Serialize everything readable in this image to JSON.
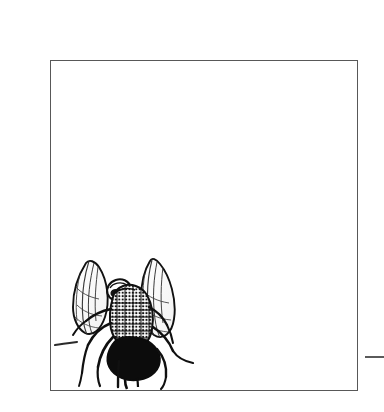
{
  "page": {
    "background_color": "#ffffff",
    "width": 384,
    "height": 412
  },
  "figure": {
    "frame": {
      "border_color": "#585858",
      "border_width_px": 1.4,
      "fill_color": "#ffffff",
      "left": 50,
      "top": 60,
      "width": 308,
      "height": 331,
      "caption": ""
    },
    "illustration": {
      "subject": "housefly",
      "style": "pen-and-ink stipple and hatch engraving",
      "ink_color": "#111111",
      "wing_vein_color": "#3a3a3a",
      "position": "lower-left of frame",
      "parts": [
        "left wing",
        "right wing",
        "head",
        "thorax",
        "abdomen",
        "legs",
        "detached stray stroke"
      ],
      "label": ""
    }
  },
  "margin_marks": {
    "right_tick": {
      "color": "#5a5a5a",
      "left": 365,
      "top": 356,
      "width": 19,
      "height": 2,
      "label": ""
    }
  }
}
